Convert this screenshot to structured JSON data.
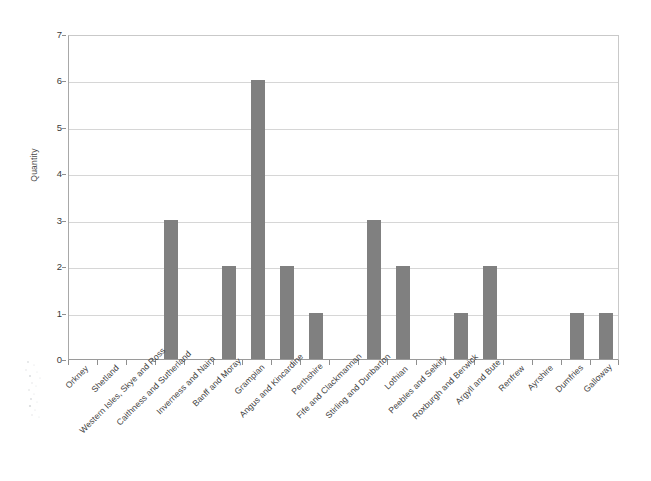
{
  "chart_data": {
    "type": "bar",
    "title": "",
    "xlabel": "",
    "ylabel": "Quantity",
    "ylim": [
      0,
      7
    ],
    "ytick_labels": [
      "0",
      "1",
      "2",
      "3",
      "4",
      "5",
      "6",
      "7"
    ],
    "grid": true,
    "legend": "none",
    "bar_color": "#808080",
    "categories": [
      "Orkney",
      "Shetland",
      "Western Isles, Skye and Ross",
      "Caithness and Sutherland",
      "Inverness and Nairn",
      "Banff and Moray",
      "Grampian",
      "Angus and Kincardine",
      "Perthshire",
      "Fife and Clackmannan",
      "Stirling and Dunbarton",
      "Lothian",
      "Peebles and Selkirk",
      "Roxburgh and Berwick",
      "Argyll and Bute",
      "Renfrew",
      "Ayrshire",
      "Dumfries",
      "Galloway"
    ],
    "values": [
      0,
      0,
      0,
      3,
      0,
      2,
      6,
      2,
      1,
      0,
      3,
      2,
      0,
      1,
      2,
      0,
      0,
      1,
      1
    ]
  }
}
